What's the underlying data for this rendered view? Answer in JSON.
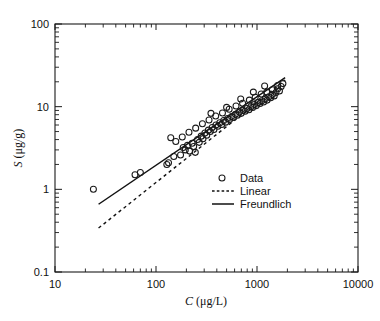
{
  "figure": {
    "background": "#ffffff",
    "ink_color": "#111111"
  },
  "chart_data": {
    "type": "scatter",
    "title": "",
    "subtitle": "",
    "xlabel": "C (μg/L)",
    "xlabel_symbol": "C",
    "xlabel_units": "(μg/L)",
    "ylabel": "S (μg/g)",
    "ylabel_symbol": "S",
    "ylabel_units": "(μg/g)",
    "xscale": "log",
    "yscale": "log",
    "xlim": [
      10,
      10000
    ],
    "ylim": [
      0.1,
      100
    ],
    "grid": false,
    "xticks": [
      10,
      100,
      1000,
      10000
    ],
    "xtick_labels": [
      "10",
      "100",
      "1000",
      "10000"
    ],
    "yticks": [
      0.1,
      1,
      10,
      100
    ],
    "ytick_labels": [
      "0.1",
      "1",
      "10",
      "100"
    ],
    "minor_ticks": true,
    "legend_position": "center-right",
    "series": [
      {
        "name": "Data",
        "type": "scatter",
        "marker": "open-circle",
        "points": [
          [
            24,
            1.0
          ],
          [
            62,
            1.5
          ],
          [
            70,
            1.6
          ],
          [
            128,
            2.0
          ],
          [
            133,
            2.1
          ],
          [
            140,
            4.2
          ],
          [
            150,
            2.5
          ],
          [
            175,
            2.6
          ],
          [
            186,
            3.2
          ],
          [
            195,
            3.0
          ],
          [
            205,
            3.4
          ],
          [
            215,
            2.9
          ],
          [
            228,
            3.6
          ],
          [
            236,
            3.3
          ],
          [
            245,
            2.8
          ],
          [
            258,
            4.0
          ],
          [
            268,
            3.7
          ],
          [
            280,
            4.4
          ],
          [
            292,
            4.1
          ],
          [
            305,
            4.8
          ],
          [
            318,
            4.5
          ],
          [
            330,
            5.2
          ],
          [
            345,
            5.0
          ],
          [
            360,
            5.6
          ],
          [
            375,
            5.3
          ],
          [
            392,
            6.0
          ],
          [
            410,
            5.8
          ],
          [
            428,
            6.4
          ],
          [
            448,
            6.1
          ],
          [
            468,
            6.8
          ],
          [
            490,
            6.5
          ],
          [
            512,
            7.2
          ],
          [
            535,
            7.0
          ],
          [
            560,
            7.6
          ],
          [
            585,
            7.4
          ],
          [
            612,
            8.1
          ],
          [
            640,
            7.9
          ],
          [
            668,
            8.6
          ],
          [
            698,
            8.3
          ],
          [
            730,
            9.0
          ],
          [
            762,
            8.8
          ],
          [
            796,
            9.5
          ],
          [
            832,
            9.2
          ],
          [
            868,
            10.0
          ],
          [
            905,
            9.8
          ],
          [
            944,
            10.6
          ],
          [
            985,
            10.3
          ],
          [
            1026,
            11.2
          ],
          [
            1070,
            10.9
          ],
          [
            1115,
            11.8
          ],
          [
            1162,
            11.4
          ],
          [
            1210,
            12.5
          ],
          [
            1260,
            12.0
          ],
          [
            1312,
            13.2
          ],
          [
            1366,
            12.8
          ],
          [
            1422,
            14.0
          ],
          [
            1480,
            13.5
          ],
          [
            1540,
            14.8
          ],
          [
            1602,
            16.5
          ],
          [
            1668,
            15.5
          ],
          [
            1735,
            17.5
          ],
          [
            1805,
            19.0
          ],
          [
            1600,
            18.0
          ],
          [
            1420,
            16.0
          ],
          [
            1250,
            15.0
          ],
          [
            1100,
            14.2
          ],
          [
            960,
            13.0
          ],
          [
            840,
            12.0
          ],
          [
            720,
            11.0
          ],
          [
            620,
            10.2
          ],
          [
            530,
            9.3
          ],
          [
            455,
            8.4
          ],
          [
            390,
            7.7
          ],
          [
            335,
            6.9
          ],
          [
            288,
            6.2
          ],
          [
            247,
            5.5
          ],
          [
            212,
            4.9
          ],
          [
            182,
            4.3
          ],
          [
            157,
            3.8
          ],
          [
            350,
            8.3
          ],
          [
            500,
            9.8
          ],
          [
            690,
            12.4
          ],
          [
            920,
            15.0
          ],
          [
            1190,
            17.8
          ]
        ]
      },
      {
        "name": "Linear",
        "type": "line",
        "style": "dashed",
        "endpoints": [
          [
            27,
            0.34
          ],
          [
            1900,
            21.0
          ]
        ],
        "description": "linear isotherm fit, slope 1 on log-log"
      },
      {
        "name": "Freundlich",
        "type": "line",
        "style": "solid",
        "endpoints": [
          [
            27,
            0.66
          ],
          [
            1900,
            22.5
          ]
        ],
        "description": "Freundlich isotherm fit, slope < 1 on log-log"
      }
    ],
    "legend_entries": [
      {
        "label": "Data",
        "marker": "open-circle",
        "style": "marker"
      },
      {
        "label": "Linear",
        "marker": "line",
        "style": "dashed"
      },
      {
        "label": "Freundlich",
        "marker": "line",
        "style": "solid"
      }
    ]
  }
}
